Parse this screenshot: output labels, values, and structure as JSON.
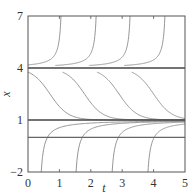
{
  "chart_data": {
    "type": "line",
    "title": "",
    "xlabel": "t",
    "ylabel": "x",
    "xlim": [
      0,
      5
    ],
    "ylim": [
      -2,
      7
    ],
    "xticks": [
      0,
      1,
      2,
      3,
      4,
      5
    ],
    "yticks": [
      -2,
      1,
      4,
      7
    ],
    "grid": false,
    "legend": null,
    "equilibria": [
      {
        "x": 4,
        "label": "unstable equilibrium",
        "style": "dark"
      },
      {
        "x": 1,
        "label": "stable equilibrium",
        "style": "dark"
      },
      {
        "x": 0,
        "label": "reference line",
        "style": "medium"
      }
    ],
    "solution_families": {
      "above_4": {
        "description": "solutions starting above x=4 blow up, reaching x=7",
        "reach_top_at_t": [
          1.05,
          2.17,
          3.25,
          4.36
        ]
      },
      "between_1_and_4": {
        "description": "decreasing S-shaped solutions from near 4 to 1",
        "inflection_t": [
          0.7,
          1.8,
          2.9,
          4.0
        ],
        "start_value_at_t0": 3.76
      },
      "below_1": {
        "description": "solutions rising from x=-2 toward 1",
        "leave_bottom_at_t": [
          0.42,
          1.53,
          2.68,
          3.82
        ]
      }
    }
  },
  "colors": {
    "frame": "#555555",
    "equilibrium": "#444444",
    "curve": "#8a8a8a",
    "text": "#333333"
  },
  "axis": {
    "xlabel": "t",
    "ylabel": "x",
    "xtick_labels": [
      "0",
      "1",
      "2",
      "3",
      "4",
      "5"
    ],
    "ytick_labels": [
      "-2",
      "1",
      "4",
      "7"
    ]
  }
}
